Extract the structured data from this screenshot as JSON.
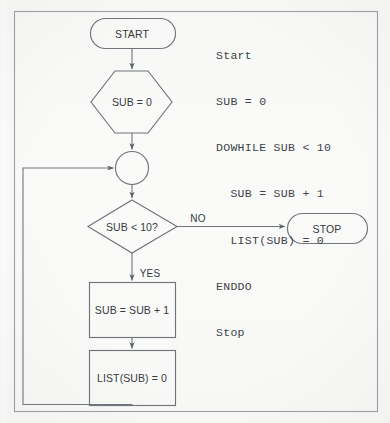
{
  "figure": {
    "background_color": "#fdfdfc",
    "stroke_color": "#6e757c",
    "text_color": "#343a40",
    "code_text_color": "#3d4348"
  },
  "code_listing": {
    "lines": [
      "Start",
      "SUB = 0",
      "DOWHILE SUB < 10",
      "  SUB = SUB + 1",
      "  LIST(SUB) = 0",
      "ENDDO",
      "Stop"
    ]
  },
  "flowchart": {
    "nodes": [
      {
        "id": "start",
        "type": "terminator",
        "label": "START"
      },
      {
        "id": "init",
        "type": "preparation",
        "label": "SUB = 0"
      },
      {
        "id": "connector",
        "type": "connector",
        "label": ""
      },
      {
        "id": "decision",
        "type": "decision",
        "label": "SUB < 10?"
      },
      {
        "id": "increment",
        "type": "process",
        "label": "SUB = SUB + 1"
      },
      {
        "id": "assign",
        "type": "process",
        "label": "LIST(SUB) = 0"
      },
      {
        "id": "stop",
        "type": "terminator",
        "label": "STOP"
      }
    ],
    "edge_labels": {
      "no": "NO",
      "yes": "YES"
    }
  }
}
